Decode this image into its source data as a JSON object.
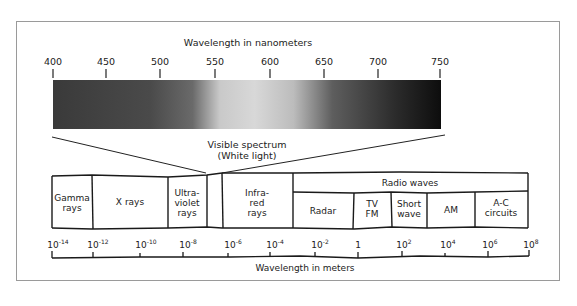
{
  "nm_axis": {
    "label": "Wavelength in nanometers",
    "ticks": [
      "400",
      "450",
      "500",
      "550",
      "600",
      "650",
      "700",
      "750"
    ]
  },
  "visible": {
    "label_line1": "Visible spectrum",
    "label_line2": "(White light)"
  },
  "bands": {
    "gamma": [
      "Gamma",
      "rays"
    ],
    "xray": [
      "X rays"
    ],
    "uv": [
      "Ultra-",
      "violet",
      "rays"
    ],
    "ir": [
      "Infra-",
      "red",
      "rays"
    ],
    "radio": "Radio waves",
    "radar": [
      "Radar"
    ],
    "tvfm": [
      "TV",
      "FM"
    ],
    "short": [
      "Short",
      "wave"
    ],
    "am": [
      "AM"
    ],
    "ac": [
      "A-C",
      "circuits"
    ]
  },
  "m_axis": {
    "label": "Wavelength in meters",
    "ticks": [
      {
        "base": "10",
        "exp": "-14"
      },
      {
        "base": "10",
        "exp": "-12"
      },
      {
        "base": "10",
        "exp": "-10"
      },
      {
        "base": "10",
        "exp": "-8"
      },
      {
        "base": "10",
        "exp": "-6"
      },
      {
        "base": "10",
        "exp": "-4"
      },
      {
        "base": "10",
        "exp": "-2"
      },
      {
        "base": "1",
        "exp": ""
      },
      {
        "base": "10",
        "exp": "2"
      },
      {
        "base": "10",
        "exp": "4"
      },
      {
        "base": "10",
        "exp": "6"
      },
      {
        "base": "10",
        "exp": "8"
      }
    ]
  },
  "colors": {
    "line": "#1a1a1a",
    "frame": "#9a9a9a",
    "spectrum_dark": "#2a2a2a",
    "spectrum_light": "#d4d4d4"
  }
}
